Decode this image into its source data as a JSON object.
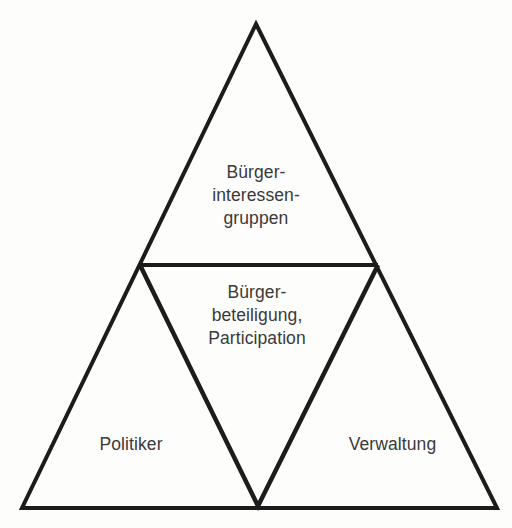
{
  "diagram": {
    "type": "nested-triangle-diagram",
    "background_color": "#fdfdfb",
    "line_color": "#1c1c1c",
    "text_color": "#3a3a3a",
    "outer_triangle": {
      "apex": [
        256,
        24
      ],
      "base_left": [
        22,
        508
      ],
      "base_right": [
        497,
        508
      ]
    },
    "divider_line": {
      "left_point": [
        140,
        265
      ],
      "right_point": [
        378,
        265
      ]
    },
    "inner_inverted_triangle": {
      "top_left": [
        140,
        265
      ],
      "top_right": [
        378,
        265
      ],
      "bottom_vertex": [
        258,
        506
      ]
    },
    "zones": {
      "top": {
        "name": "buerger-interessengruppen",
        "label": "Bürger-\ninteressen-\ngruppen"
      },
      "center": {
        "name": "buergerbeteiligung-participation",
        "label": "Bürger-\nbeteiligung,\nParticipation"
      },
      "bottom_left": {
        "name": "politiker",
        "label": "Politiker"
      },
      "bottom_right": {
        "name": "verwaltung",
        "label": "Verwaltung"
      }
    }
  }
}
